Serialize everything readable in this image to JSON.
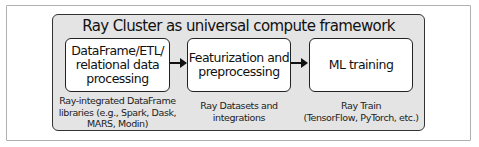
{
  "diagram": {
    "title": "Ray Cluster as universal compute framework",
    "stages": [
      {
        "lines": [
          "DataFrame/ETL/",
          "relational data",
          "processing"
        ],
        "caption": [
          "Ray-integrated DataFrame",
          "libraries (e.g., Spark, Dask,",
          "MARS, Modin)"
        ]
      },
      {
        "lines": [
          "Featurization and",
          "preprocessing"
        ],
        "caption": [
          "Ray Datasets and",
          "integrations"
        ]
      },
      {
        "lines": [
          "ML training"
        ],
        "caption": [
          "Ray Train",
          "(TensorFlow, PyTorch, etc.)"
        ]
      }
    ],
    "edges": [
      {
        "from": 0,
        "to": 1
      },
      {
        "from": 1,
        "to": 2
      }
    ],
    "colors": {
      "cluster_fill": "#e4e4e4",
      "box_fill": "#ffffff",
      "stroke": "#222222"
    }
  }
}
